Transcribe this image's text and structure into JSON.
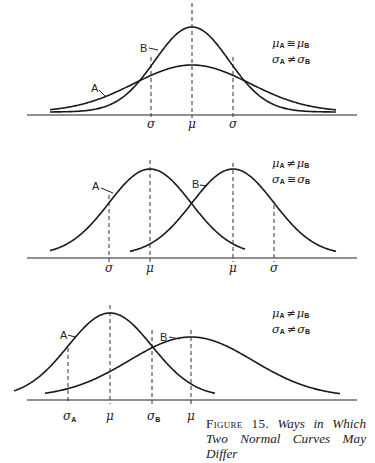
{
  "figure": {
    "number_label": "Figure 15.",
    "title": "Ways in Which Two Normal Curves May Differ"
  },
  "chart_data": [
    {
      "type": "line",
      "title": "Panel 1: same mean, different standard deviations",
      "legend": [
        "μA ≅ μB",
        "σA ≠ σB"
      ],
      "series": [
        {
          "name": "A",
          "mean": 192,
          "sd": 58,
          "peak_height": 47,
          "x_range": [
            50,
            336
          ],
          "description": "wide, flat curve"
        },
        {
          "name": "B",
          "mean": 192,
          "sd": 37,
          "peak_height": 85,
          "x_range": [
            50,
            336
          ],
          "description": "narrow, tall curve"
        }
      ],
      "ticks": [
        {
          "label": "σ",
          "x": 151
        },
        {
          "label": "μ",
          "x": 192
        },
        {
          "label": "σ",
          "x": 233
        }
      ],
      "baseline_y": 115,
      "grid": false
    },
    {
      "type": "line",
      "title": "Panel 2: different means, same standard deviation",
      "legend": [
        "μA ≠ μB",
        "σA ≅ σB"
      ],
      "series": [
        {
          "name": "A",
          "mean": 150,
          "sd": 41,
          "peak_height": 86,
          "x_range": [
            50,
            245
          ]
        },
        {
          "name": "B",
          "mean": 233,
          "sd": 41,
          "peak_height": 86,
          "x_range": [
            130,
            336
          ]
        }
      ],
      "ticks": [
        {
          "label": "σ",
          "x": 109
        },
        {
          "label": "μ",
          "x": 150
        },
        {
          "label": "μ",
          "x": 233
        },
        {
          "label": "σ",
          "x": 274
        }
      ],
      "baseline_y": 258,
      "grid": false
    },
    {
      "type": "line",
      "title": "Panel 3: different means and different standard deviations",
      "legend": [
        "μA ≠ μB",
        "σA ≠ σB"
      ],
      "series": [
        {
          "name": "A",
          "mean": 110,
          "sd": 42,
          "peak_height": 84,
          "x_range": [
            14,
            215
          ]
        },
        {
          "name": "B",
          "mean": 191,
          "sd": 62,
          "peak_height": 60,
          "x_range": [
            45,
            340
          ]
        }
      ],
      "ticks": [
        {
          "label": "σA",
          "x": 68
        },
        {
          "label": "μ",
          "x": 110
        },
        {
          "label": "σB",
          "x": 152
        },
        {
          "label": "μ",
          "x": 191
        }
      ],
      "baseline_y": 400,
      "grid": false
    }
  ],
  "panels": [
    {
      "legend_line1": {
        "left": "μ",
        "left_sub": "A",
        "op": "≅",
        "right": "μ",
        "right_sub": "B"
      },
      "legend_line2": {
        "left": "σ",
        "left_sub": "A",
        "op": "≠",
        "right": "σ",
        "right_sub": "B"
      },
      "tick_labels": [
        "σ",
        "μ",
        "σ"
      ],
      "curve_labels": [
        "A",
        "B"
      ]
    },
    {
      "legend_line1": {
        "left": "μ",
        "left_sub": "A",
        "op": "≠",
        "right": "μ",
        "right_sub": "B"
      },
      "legend_line2": {
        "left": "σ",
        "left_sub": "A",
        "op": "≅",
        "right": "σ",
        "right_sub": "B"
      },
      "tick_labels": [
        "σ",
        "μ",
        "μ",
        "σ"
      ],
      "curve_labels": [
        "A",
        "B"
      ]
    },
    {
      "legend_line1": {
        "left": "μ",
        "left_sub": "A",
        "op": "≠",
        "right": "μ",
        "right_sub": "B"
      },
      "legend_line2": {
        "left": "σ",
        "left_sub": "A",
        "op": "≠",
        "right": "σ",
        "right_sub": "B"
      },
      "tick_labels": [
        {
          "main": "σ",
          "sub": "A"
        },
        {
          "main": "μ",
          "sub": ""
        },
        {
          "main": "σ",
          "sub": "B"
        },
        {
          "main": "μ",
          "sub": ""
        }
      ],
      "curve_labels": [
        "A",
        "B"
      ]
    }
  ]
}
